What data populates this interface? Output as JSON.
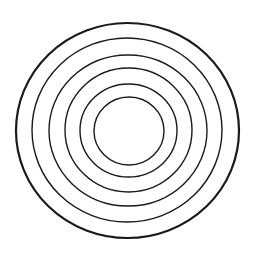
{
  "diagram": {
    "type": "concentric-circles",
    "background": "#ffffff",
    "stroke_color": "#1a1a1a",
    "ring_count": 6,
    "rings": [
      {
        "cx": 127.5,
        "cy": 130.5,
        "rx": 111.5,
        "ry": 107.5,
        "stroke_width": 2.2
      },
      {
        "cx": 127.0,
        "cy": 130.0,
        "rx": 95.0,
        "ry": 92.0,
        "stroke_width": 1.4
      },
      {
        "cx": 128.0,
        "cy": 130.5,
        "rx": 79.0,
        "ry": 75.5,
        "stroke_width": 1.4
      },
      {
        "cx": 128.5,
        "cy": 130.0,
        "rx": 63.5,
        "ry": 62.0,
        "stroke_width": 1.4
      },
      {
        "cx": 128.5,
        "cy": 130.5,
        "rx": 48.5,
        "ry": 46.5,
        "stroke_width": 1.4
      },
      {
        "cx": 129.0,
        "cy": 131.0,
        "rx": 35.0,
        "ry": 34.0,
        "stroke_width": 1.4
      }
    ]
  }
}
